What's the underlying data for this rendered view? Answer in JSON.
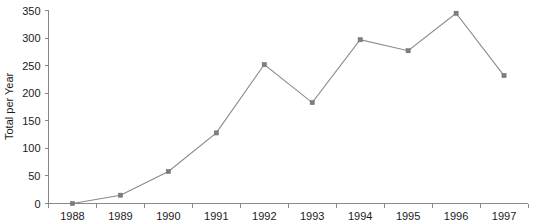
{
  "chart_data": {
    "type": "line",
    "title": "",
    "xlabel": "",
    "ylabel": "Total per Year",
    "categories": [
      "1988",
      "1989",
      "1990",
      "1991",
      "1992",
      "1993",
      "1994",
      "1995",
      "1996",
      "1997"
    ],
    "values": [
      0,
      15,
      58,
      128,
      252,
      183,
      297,
      277,
      345,
      232
    ],
    "series": [
      {
        "name": "Total per Year",
        "values": [
          0,
          15,
          58,
          128,
          252,
          183,
          297,
          277,
          345,
          232
        ]
      }
    ],
    "ylim": [
      0,
      350
    ],
    "ytick_labels": [
      "0",
      "50",
      "100",
      "150",
      "200",
      "250",
      "300",
      "350"
    ],
    "ytick_values": [
      0,
      50,
      100,
      150,
      200,
      250,
      300,
      350
    ],
    "xtick_labels": [
      "1988",
      "1989",
      "1990",
      "1991",
      "1992",
      "1993",
      "1994",
      "1995",
      "1996",
      "1997"
    ],
    "grid": false,
    "legend": false,
    "legend_position": "none",
    "marker": "square",
    "line_color": "#8a8a8a",
    "marker_color": "#7d7d7d",
    "axis_color": "#888888",
    "text_color": "#1a1a1a",
    "background_color": "#ffffff"
  }
}
